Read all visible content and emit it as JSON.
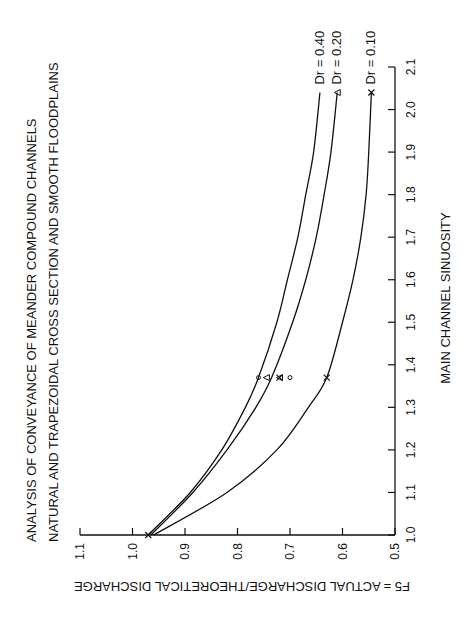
{
  "chart_data": {
    "type": "line",
    "orientation": "rotated-90-ccw",
    "title": "ANALYSIS OF CONVEYANCE OF MEANDER COMPOUND CHANNELS",
    "subtitle": "NATURAL AND TRAPEZOIDAL CROSS SECTION AND SMOOTH FLOODPLAINS",
    "xlabel": "MAIN CHANNEL SINUOSITY",
    "ylabel": "F5 = ACTUAL DISCHARGE/THEORETICAL DISCHARGE",
    "xlim": [
      1.0,
      2.1
    ],
    "ylim": [
      0.5,
      1.1
    ],
    "x_ticks": [
      "1.0",
      "1.1",
      "1.2",
      "1.3",
      "1.4",
      "1.5",
      "1.6",
      "1.7",
      "1.8",
      "1.9",
      "2.0",
      "2.1"
    ],
    "y_ticks": [
      "1.1",
      "1.0",
      "0.9",
      "0.8",
      "0.7",
      "0.6",
      "0.5"
    ],
    "grid": false,
    "series": [
      {
        "name": "Dr = 0.40",
        "marker": "circle",
        "x": [
          1.0,
          1.1,
          1.2,
          1.3,
          1.37,
          1.5,
          1.6,
          1.7,
          1.8,
          1.9,
          2.04
        ],
        "values": [
          0.97,
          0.89,
          0.83,
          0.785,
          0.76,
          0.725,
          0.705,
          0.685,
          0.67,
          0.655,
          0.643
        ]
      },
      {
        "name": "Dr = 0.20",
        "marker": "triangle",
        "x": [
          1.0,
          1.1,
          1.2,
          1.3,
          1.37,
          1.5,
          1.6,
          1.7,
          1.8,
          1.9,
          2.04
        ],
        "values": [
          0.965,
          0.885,
          0.82,
          0.765,
          0.735,
          0.695,
          0.67,
          0.65,
          0.635,
          0.622,
          0.61
        ]
      },
      {
        "name": "Dr = 0.10",
        "marker": "x",
        "x": [
          1.0,
          1.1,
          1.2,
          1.3,
          1.37,
          1.5,
          1.6,
          1.7,
          1.8,
          1.9,
          2.04
        ],
        "values": [
          0.96,
          0.82,
          0.725,
          0.665,
          0.63,
          0.6,
          0.58,
          0.565,
          0.555,
          0.55,
          0.545
        ]
      }
    ],
    "points": [
      {
        "series": "Dr = 0.40",
        "marker": "circle",
        "x": 1.37,
        "y": 0.76
      },
      {
        "series": "Dr = 0.40",
        "marker": "circle",
        "x": 1.37,
        "y": 0.7
      },
      {
        "series": "Dr = 0.20",
        "marker": "triangle",
        "x": 1.37,
        "y": 0.745
      },
      {
        "series": "Dr = 0.20",
        "marker": "triangle",
        "x": 1.37,
        "y": 0.72
      },
      {
        "series": "Dr = 0.10",
        "marker": "x",
        "x": 1.37,
        "y": 0.72
      },
      {
        "series": "Dr = 0.10",
        "marker": "x",
        "x": 1.37,
        "y": 0.63
      },
      {
        "series": "Dr = 0.10",
        "marker": "x",
        "x": 2.04,
        "y": 0.545
      },
      {
        "series": "Dr = 0.20",
        "marker": "triangle",
        "x": 2.04,
        "y": 0.61
      },
      {
        "series": "ALL",
        "marker": "x",
        "x": 1.0,
        "y": 0.97
      }
    ],
    "legend": {
      "position": "curve-end-labels",
      "entries": [
        "Dr = 0.40",
        "Dr = 0.20",
        "Dr = 0.10"
      ]
    }
  }
}
